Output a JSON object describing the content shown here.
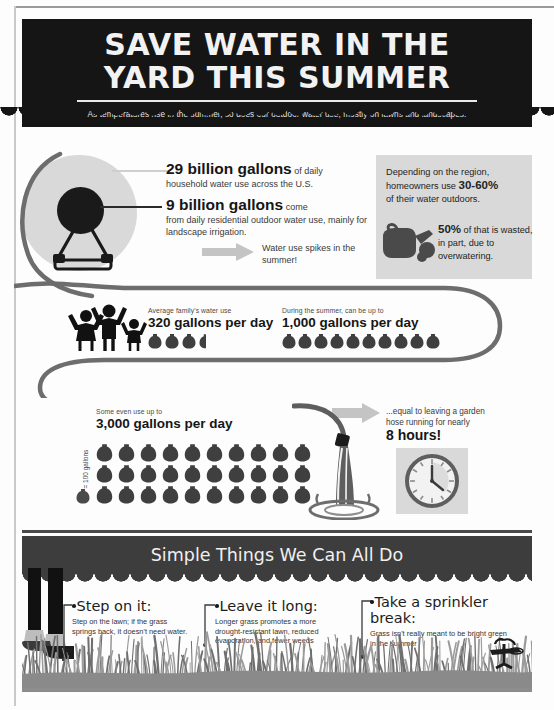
{
  "header": {
    "title_line1": "SAVE WATER IN THE",
    "title_line2": "YARD THIS SUMMER",
    "subtitle": "As temperatures rise in the summer, so does our outdoor water use, mostly on lawns and landscapes."
  },
  "section_stats": {
    "stat29_big": "29 billion gallons",
    "stat29_inline": " of daily",
    "stat29_sub": "household water use across the U.S.",
    "stat9_big": "9 billion gallons",
    "stat9_inline": " come",
    "stat9_sub": "from daily residential outdoor water use, mainly for landscape irrigation.",
    "spike_text": "Water use spikes in the summer!"
  },
  "region_box": {
    "line1": "Depending on the region,",
    "line2_pre": "homeowners use ",
    "line2_bold": "30-60%",
    "line3": "of their water outdoors.",
    "wasted_bold": "50%",
    "wasted_rest": " of that is wasted, in part, due to overwatering."
  },
  "family": {
    "label": "Average family's water use",
    "value": "320 gallons per day",
    "bucket_count": 3,
    "half_bucket": true
  },
  "summer": {
    "label": "During the summer, can be up to",
    "value": "1,000 gallons per day",
    "bucket_count": 10,
    "half_bucket": false
  },
  "extreme": {
    "label": "Some even use up to",
    "value": "3,000 gallons per day",
    "bucket_count": 30,
    "legend": "= 100 gallons"
  },
  "hose_equiv": {
    "line1": "...equal to leaving a garden",
    "line2": "hose running for nearly",
    "hours": "8 hours!"
  },
  "simple_things": {
    "banner_title": "Simple Things We Can All Do",
    "tips": [
      {
        "head": "Step on it:",
        "body": "Step on the lawn; if the grass springs back, it doesn't need water."
      },
      {
        "head": "Leave it long:",
        "body": "Longer grass promotes a more drought-resistant lawn, reduced evaporation, and fewer weeds"
      },
      {
        "head": "Take a sprinkler break:",
        "body": "Grass isn't really meant to be bright green in the summer"
      }
    ]
  },
  "colors": {
    "header_black": "#151515",
    "banner_gray": "#3d3d3d",
    "box_gray": "#d9d9d9",
    "icon_dark": "#3f3f3f",
    "arrow_gray": "#c4c4c4"
  }
}
